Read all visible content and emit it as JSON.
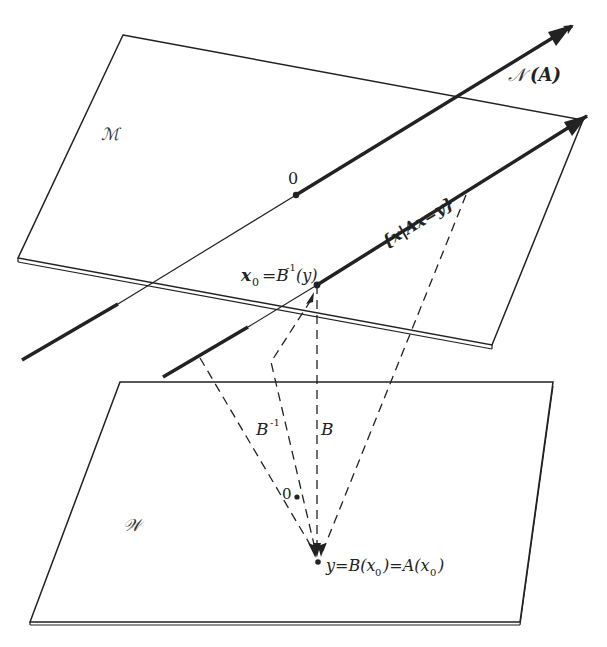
{
  "figure": {
    "type": "linear-algebra diagram",
    "colors": {
      "ink": "#222222",
      "background": "#ffffff"
    }
  },
  "planes": {
    "upper": {
      "label": "ℳ"
    },
    "lower": {
      "label": "𝒲"
    }
  },
  "lines": {
    "null_space": {
      "label_main": "𝒩",
      "label_arg": "(A)"
    },
    "affine_set": {
      "label": "{x|Ax=y}"
    }
  },
  "points": {
    "origin_upper": {
      "label": "0"
    },
    "x0": {
      "label_x": "x",
      "label_sub": "0",
      "label_eq": "=B",
      "label_sup": "-1",
      "label_arg": "(y)"
    },
    "origin_lower": {
      "label": "0"
    },
    "y": {
      "label": "y=B(x",
      "label_sub": "0",
      "label_mid": ")=A(x",
      "label_sub2": "0",
      "label_end": ")"
    }
  },
  "maps": {
    "inverse": {
      "label": "B",
      "sup": "-1"
    },
    "forward": {
      "label": "B"
    }
  }
}
